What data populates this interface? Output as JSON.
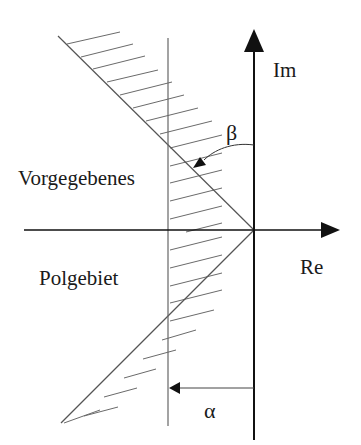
{
  "diagram": {
    "type": "complex-plane pole region",
    "axes": {
      "imaginary_label": "Im",
      "real_label": "Re"
    },
    "angles": {
      "beta_label": "β",
      "alpha_label": "α"
    },
    "region_label": {
      "line1": "Vorgegebenes",
      "line2": "Polgebiet"
    },
    "colors": {
      "axis": "#111111",
      "boundary": "#555555",
      "hatch": "#6a6a6a",
      "background": "#ffffff"
    }
  }
}
